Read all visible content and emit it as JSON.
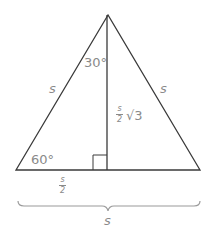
{
  "diagram": {
    "labels": {
      "apex_angle": "30°",
      "left_side": "s",
      "right_side": "s",
      "altitude_frac_num": "s",
      "altitude_frac_den": "2",
      "altitude_root": "√3",
      "base_angle": "60°",
      "half_base_num": "s",
      "half_base_den": "2",
      "full_base": "s"
    },
    "colors": {
      "line": "#3a3a3a",
      "text": "#8a8a8a",
      "brace": "#9a9a9a"
    }
  }
}
